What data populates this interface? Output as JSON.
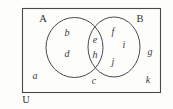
{
  "figure": {
    "kind": "venn-diagram",
    "universe_label": "U",
    "set_a_label": "A",
    "set_b_label": "B",
    "colors": {
      "stroke": "#4a4a4a",
      "text": "#3b3b3b",
      "background": "#fdfdfc"
    },
    "region_labels": {
      "outside_both_left": "a",
      "only_a_upper": "b",
      "only_a_lower": "d",
      "intersection_upper": "e",
      "intersection_lower": "h",
      "only_b_upper": "f",
      "only_b_right": "i",
      "only_b_lower": "j",
      "below_intersection": "c",
      "outside_both_right_upper": "g",
      "outside_both_right_lower": "k"
    }
  }
}
